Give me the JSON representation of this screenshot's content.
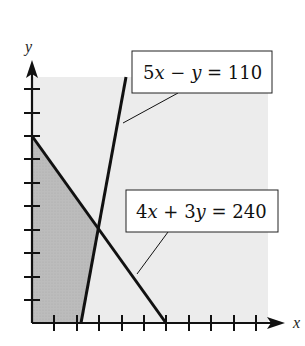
{
  "diagram": {
    "type": "linear-programming-feasible-region",
    "axes": {
      "x_label": "x",
      "y_label": "y",
      "x_ticks": 10,
      "y_ticks": 10,
      "tick_unit": 10
    },
    "lines": [
      {
        "id": "line1",
        "equation_parts": [
          "5",
          "x",
          " − ",
          "y",
          " = 110"
        ],
        "equation": "5x − y = 110",
        "points": [
          [
            22,
            0
          ],
          [
            40,
            90
          ]
        ]
      },
      {
        "id": "line2",
        "equation_parts": [
          "4",
          "x",
          " + 3",
          "y",
          " = 240"
        ],
        "equation": "4x + 3y = 240",
        "points": [
          [
            0,
            80
          ],
          [
            60,
            0
          ]
        ]
      }
    ],
    "intersection": [
      30,
      40
    ],
    "feasible_region_vertices": [
      [
        0,
        0
      ],
      [
        22,
        0
      ],
      [
        30,
        40
      ],
      [
        0,
        80
      ]
    ],
    "colors": {
      "background_region": "#ececec",
      "feasible_region": "#b9b9b9",
      "lines": "#111111"
    }
  }
}
